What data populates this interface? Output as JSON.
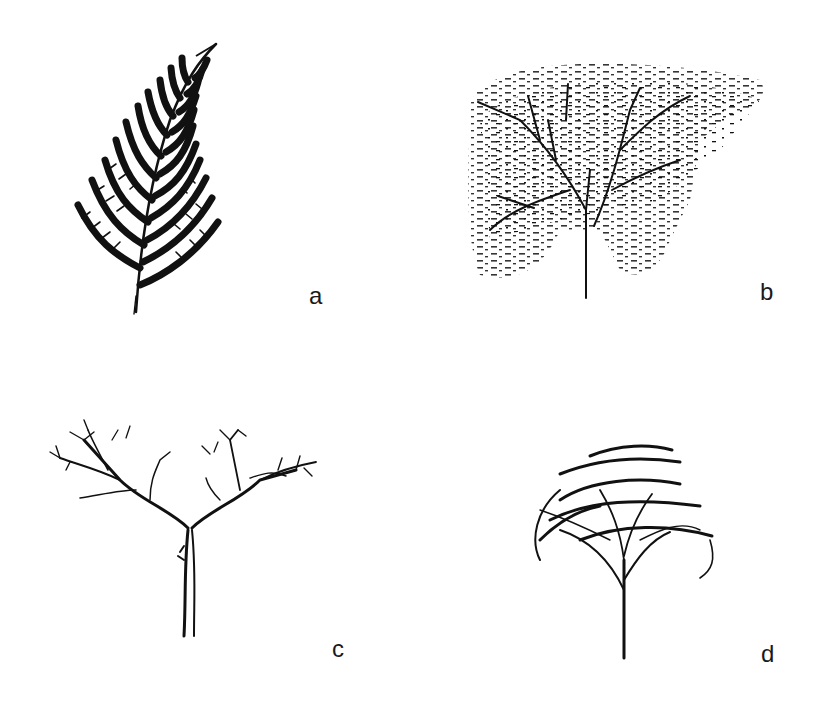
{
  "figure": {
    "panels": [
      {
        "id": "a",
        "label": "a",
        "subject": "fern-frond"
      },
      {
        "id": "b",
        "label": "b",
        "subject": "speckled-spreading-tree"
      },
      {
        "id": "c",
        "label": "c",
        "subject": "y-branching-tree"
      },
      {
        "id": "d",
        "label": "d",
        "subject": "umbrella-canopy-tree"
      }
    ]
  }
}
